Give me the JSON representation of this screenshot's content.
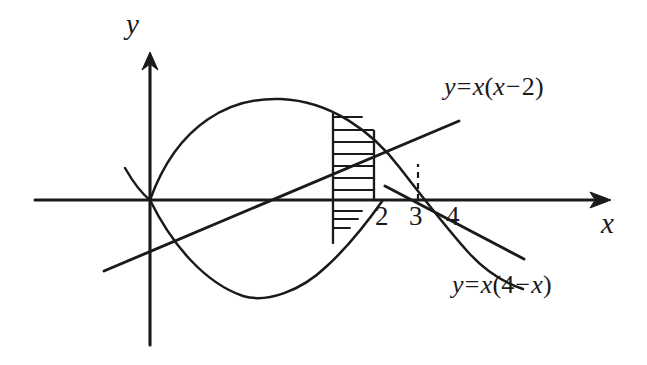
{
  "figure": {
    "background_color": "#ffffff",
    "ink_color": "#1a1a1a",
    "width": 647,
    "height": 365
  },
  "axes": {
    "x_label": "x",
    "y_label": "y",
    "origin_px": {
      "x": 150,
      "y": 200
    },
    "x_tick_labels": [
      "2",
      "3",
      "4"
    ],
    "x_tick_values": [
      2,
      3,
      4
    ],
    "x_tick_px": [
      383,
      418,
      455
    ],
    "x_axis_span_px": [
      35,
      600
    ],
    "y_axis_span_px": [
      58,
      345
    ],
    "has_x_arrow": true,
    "has_y_arrow": true
  },
  "curves": [
    {
      "name": "upper-parabola",
      "equation_text": "y = x(4 - x)",
      "equation_parts": {
        "lhs": "y",
        "eq": "=",
        "coef": "x",
        "open": "(",
        "a": "4",
        "op": "−",
        "b": "x",
        "close": ")"
      },
      "roots": [
        0,
        4
      ],
      "vertex": {
        "x": 2,
        "y": 4
      },
      "opens": "down"
    },
    {
      "name": "lower-parabola",
      "equation_text": "y = x(x - 2)",
      "equation_parts": {
        "lhs": "y",
        "eq": "=",
        "coef": "x",
        "open": "(",
        "a": "x",
        "op": "−",
        "b": "2",
        "close": ")"
      },
      "roots": [
        0,
        2
      ],
      "vertex": {
        "x": 1,
        "y": -1
      },
      "opens": "up"
    }
  ],
  "annotations": {
    "hatched_strip": {
      "description": "vertical hatched strip representing a typical element of area",
      "left_px": 333,
      "right_px": 374,
      "hatch_count_above_axis": 8,
      "hatch_count_below_axis": 3,
      "orientation": "horizontal"
    },
    "dashed_vertical": {
      "at_x_value": 3,
      "at_x_px": 418,
      "from_px_y": 200,
      "to_px_y": 165,
      "style": "dashed"
    },
    "intersection_point": {
      "x": 3,
      "y": 3,
      "px": {
        "x": 418,
        "y": 165
      }
    }
  },
  "labels": {
    "equation_upper": "y = x(4 − x)",
    "equation_lower": "y = x(x − 2)"
  }
}
